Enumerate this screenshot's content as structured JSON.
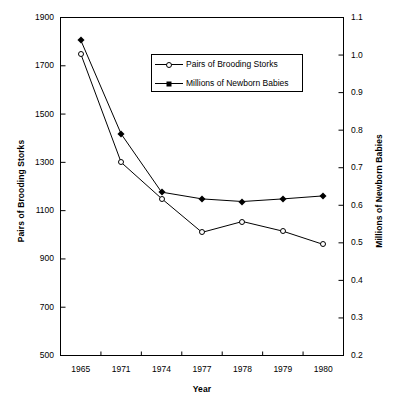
{
  "chart_data": {
    "type": "line",
    "title": "",
    "xlabel": "Year",
    "categories": [
      "1965",
      "1971",
      "1974",
      "1977",
      "1978",
      "1979",
      "1980"
    ],
    "grid": false,
    "legend_position": "upper-center",
    "series": [
      {
        "name": "Pairs of Brooding Storks",
        "axis": "left",
        "marker": "open-circle",
        "values": [
          1750,
          1300,
          1150,
          1010,
          1055,
          1015,
          960
        ]
      },
      {
        "name": "Millions of Newborn Babies",
        "axis": "right",
        "marker": "filled-diamond",
        "values": [
          1.04,
          0.79,
          0.635,
          0.617,
          0.61,
          0.617,
          0.625
        ]
      }
    ],
    "axes": {
      "left": {
        "label": "Pairs of Brooding Storks",
        "lim": [
          500,
          1900
        ],
        "ticks": [
          1900,
          1700,
          1500,
          1300,
          1100,
          900,
          700,
          500
        ],
        "tick_labels": [
          "1900",
          "1700",
          "1500",
          "1300",
          "1100",
          "900",
          "700",
          "500"
        ]
      },
      "right": {
        "label": "Millions of Newborn Babies",
        "lim": [
          0.2,
          1.1
        ],
        "ticks": [
          1.1,
          1.0,
          0.9,
          0.8,
          0.7,
          0.6,
          0.5,
          0.4,
          0.3,
          0.2
        ],
        "tick_labels": [
          "1.1",
          "1.0",
          "0.9",
          "0.8",
          "0.7",
          "0.6",
          "0.5",
          "0.4",
          "0.3",
          "0.2"
        ]
      },
      "x": {
        "label": "Year",
        "tick_labels": [
          "1965",
          "1971",
          "1974",
          "1977",
          "1978",
          "1979",
          "1980"
        ]
      }
    },
    "colors": {
      "line": "#000000",
      "marker_fill_storks": "#ffffff",
      "marker_fill_babies": "#000000",
      "background": "#ffffff",
      "axis": "#000000"
    }
  },
  "legend": {
    "entries": [
      {
        "label": "Pairs of Brooding Storks",
        "marker": "open-circle"
      },
      {
        "label": "Millions of Newborn Babies",
        "marker": "filled-diamond"
      }
    ]
  }
}
